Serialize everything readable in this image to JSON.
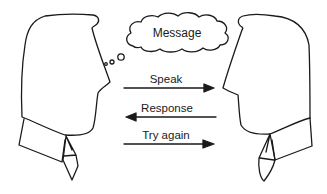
{
  "diagram": {
    "cloud": {
      "label": "Message"
    },
    "arrows": [
      {
        "label": "Speak",
        "direction": "right"
      },
      {
        "label": "Response",
        "direction": "left"
      },
      {
        "label": "Try again",
        "direction": "right"
      }
    ],
    "figures": [
      {
        "role": "speaker",
        "facing": "right"
      },
      {
        "role": "listener",
        "facing": "left"
      }
    ],
    "colors": {
      "stroke": "#1a1a1a",
      "background": "#ffffff"
    }
  }
}
